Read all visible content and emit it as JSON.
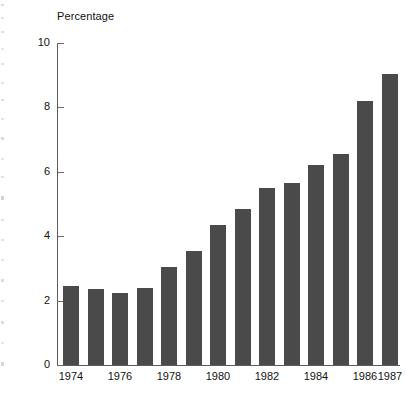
{
  "chart_data": {
    "type": "bar",
    "title": "",
    "ylabel": "Percentage",
    "xlabel": "",
    "categories": [
      "1974",
      "1975",
      "1976",
      "1977",
      "1978",
      "1979",
      "1980",
      "1981",
      "1982",
      "1983",
      "1984",
      "1985",
      "1986",
      "1987"
    ],
    "values": [
      2.45,
      2.35,
      2.25,
      2.4,
      3.05,
      3.55,
      4.35,
      4.85,
      5.5,
      5.65,
      6.2,
      6.55,
      8.2,
      9.05
    ],
    "x_tick_labels": [
      "1974",
      "1976",
      "1978",
      "1980",
      "1982",
      "1984",
      "1986",
      "1987"
    ],
    "x_tick_categories": [
      "1974",
      "1976",
      "1978",
      "1980",
      "1982",
      "1984",
      "1986",
      "1987"
    ],
    "y_tick_labels": [
      "0",
      "2",
      "4",
      "6",
      "8",
      "10"
    ],
    "y_ticks": [
      0,
      2,
      4,
      6,
      8,
      10
    ],
    "ylim": [
      0,
      10
    ],
    "grid": false,
    "legend": null,
    "bar_color": "#4a4a4a",
    "axis_color": "#5b5b5b",
    "background_color": "#ffffff"
  },
  "axis": {
    "y_title": "Percentage"
  }
}
